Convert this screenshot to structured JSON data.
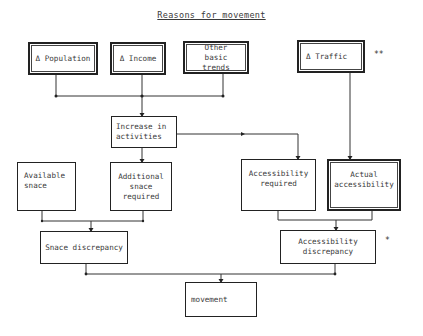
{
  "title": "Reasons for movement",
  "boxes": {
    "population": "Δ Population",
    "income": "Δ Income",
    "other_trends": "Other basic trends",
    "traffic": "Δ Traffic",
    "increase_activities": "Increase in activities",
    "available_space": "Available snace",
    "additional_space": "Additional snace required",
    "accessibility_required": "Accessibility required",
    "actual_accessibility": "Actual accessibility",
    "space_discrepancy": "Snace discrepancy",
    "accessibility_discrepancy": "Accessibility discrepancy",
    "movement": "movement"
  },
  "marks": {
    "traffic_note": "**",
    "accessibility_note": "*"
  }
}
